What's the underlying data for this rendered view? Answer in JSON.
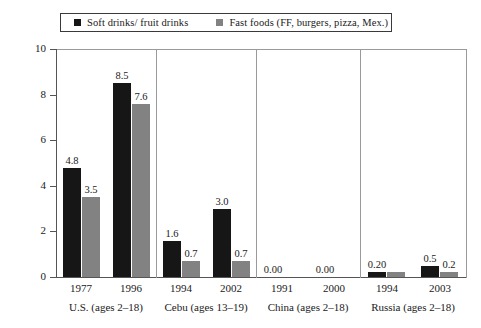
{
  "chart_data": {
    "type": "bar",
    "title": "",
    "subtitle": "",
    "xlabel": "",
    "ylabel": "Percent",
    "ylim": [
      0,
      10
    ],
    "ytick_labels": [
      "0",
      "2",
      "4",
      "6",
      "8",
      "10"
    ],
    "ytick_values": [
      0,
      2,
      4,
      6,
      8,
      10
    ],
    "grid": false,
    "legend_position": "top",
    "categories": [
      "1977",
      "1996",
      "1994",
      "2002",
      "1991",
      "2000",
      "1994",
      "2003"
    ],
    "series": [
      {
        "name": "Soft drinks/ fruit drinks",
        "color": "#161616",
        "values": [
          4.8,
          8.5,
          1.6,
          3.0,
          0.0,
          0.0,
          0.2,
          0.5
        ],
        "value_labels": [
          "4.8",
          "8.5",
          "1.6",
          "3.0",
          "0.00",
          "0.00",
          "0.20",
          "0.5"
        ]
      },
      {
        "name": "Fast foods (FF, burgers, pizza, Mex.)",
        "color": "#828282",
        "values": [
          3.5,
          7.6,
          0.7,
          0.7,
          0.0,
          0.0,
          0.2,
          0.2
        ],
        "value_labels": [
          "3.5",
          "7.6",
          "0.7",
          "0.7",
          "",
          "",
          "",
          "0.2"
        ]
      }
    ],
    "panels": [
      {
        "label": "U.S. (ages 2–18)",
        "groups": [
          {
            "tick": "1977",
            "dark": 4.8,
            "light": 3.5,
            "dark_label": "4.8",
            "light_label": "3.5"
          },
          {
            "tick": "1996",
            "dark": 8.5,
            "light": 7.6,
            "dark_label": "8.5",
            "light_label": "7.6"
          }
        ]
      },
      {
        "label": "Cebu (ages 13–19)",
        "groups": [
          {
            "tick": "1994",
            "dark": 1.6,
            "light": 0.7,
            "dark_label": "1.6",
            "light_label": "0.7"
          },
          {
            "tick": "2002",
            "dark": 3.0,
            "light": 0.7,
            "dark_label": "3.0",
            "light_label": "0.7"
          }
        ]
      },
      {
        "label": "China (ages 2–18)",
        "groups": [
          {
            "tick": "1991",
            "dark": 0.0,
            "light": 0.0,
            "dark_label": "0.00",
            "light_label": ""
          },
          {
            "tick": "2000",
            "dark": 0.0,
            "light": 0.0,
            "dark_label": "0.00",
            "light_label": ""
          }
        ]
      },
      {
        "label": "Russia (ages 2–18)",
        "groups": [
          {
            "tick": "1994",
            "dark": 0.2,
            "light": 0.2,
            "dark_label": "0.20",
            "light_label": ""
          },
          {
            "tick": "2003",
            "dark": 0.5,
            "light": 0.2,
            "dark_label": "0.5",
            "light_label": "0.2"
          }
        ]
      }
    ]
  },
  "legend": {
    "items": [
      {
        "label": "Soft drinks/ fruit drinks",
        "color": "#161616"
      },
      {
        "label": "Fast foods (FF, burgers, pizza, Mex.)",
        "color": "#828282"
      }
    ]
  },
  "axis": {
    "y_title": "Percent",
    "y_labels": [
      "10",
      "8",
      "6",
      "4",
      "2",
      "0"
    ]
  }
}
